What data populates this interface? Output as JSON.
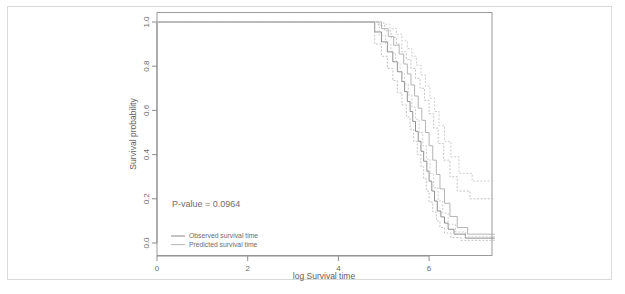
{
  "figure": {
    "background": "#ffffff",
    "frame_color": "#d9d9d9"
  },
  "chart_data": {
    "type": "line",
    "title": "",
    "subtitle": "",
    "xlabel": "log Survival time",
    "ylabel": "Survival probability",
    "xlim": [
      -0.35,
      7.6
    ],
    "ylim": [
      -0.03,
      1.03
    ],
    "xticks": [
      0,
      2,
      4,
      6
    ],
    "xticklabels": [
      "0",
      "2",
      "4",
      "6"
    ],
    "yticks": [
      0.0,
      0.2,
      0.4,
      0.6,
      0.8,
      1.0
    ],
    "yticklabels": [
      "0.0",
      "0.2",
      "0.4",
      "0.6",
      "0.8",
      "1.0"
    ],
    "grid": false,
    "legend_position": "bottom-left",
    "annotations": [
      {
        "name": "p-value",
        "text": "P-value = 0.0964",
        "x": 0.6,
        "y": 0.215
      }
    ],
    "legend": [
      {
        "label": "Observed survival time",
        "color": "#7d7d7d",
        "style": "solid"
      },
      {
        "label": "Predicted survival time",
        "color": "#a8a8a8",
        "style": "solid"
      }
    ],
    "series": [
      {
        "name": "Observed survival time",
        "color": "#7d7d7d",
        "style": "solid",
        "step": "post",
        "x": [
          0.0,
          4.72,
          4.8,
          4.95,
          5.08,
          5.2,
          5.3,
          5.4,
          5.46,
          5.52,
          5.58,
          5.64,
          5.7,
          5.76,
          5.82,
          5.88,
          5.95,
          6.0,
          6.06,
          6.12,
          6.18,
          6.26,
          6.34,
          6.42,
          6.55,
          6.8,
          7.45
        ],
        "y": [
          1.0,
          1.0,
          0.955,
          0.91,
          0.865,
          0.82,
          0.775,
          0.73,
          0.685,
          0.64,
          0.595,
          0.55,
          0.505,
          0.46,
          0.415,
          0.37,
          0.325,
          0.28,
          0.235,
          0.19,
          0.145,
          0.118,
          0.09,
          0.062,
          0.04,
          0.022,
          0.022
        ]
      },
      {
        "name": "Observed lower 95% CI",
        "color": "#b4b4b4",
        "style": "dashed",
        "step": "post",
        "x": [
          0.0,
          4.72,
          4.8,
          4.95,
          5.08,
          5.2,
          5.3,
          5.4,
          5.5,
          5.58,
          5.66,
          5.74,
          5.82,
          5.88,
          5.94,
          6.0,
          6.08,
          6.16,
          6.24,
          6.34,
          6.48,
          6.7,
          7.45
        ],
        "y": [
          1.0,
          1.0,
          0.9,
          0.845,
          0.79,
          0.735,
          0.68,
          0.625,
          0.57,
          0.515,
          0.46,
          0.4,
          0.345,
          0.29,
          0.235,
          0.185,
          0.14,
          0.1,
          0.07,
          0.045,
          0.025,
          0.012,
          0.012
        ]
      },
      {
        "name": "Observed upper 95% CI",
        "color": "#b4b4b4",
        "style": "dashed",
        "step": "post",
        "x": [
          0.0,
          4.72,
          4.88,
          5.02,
          5.16,
          5.28,
          5.4,
          5.5,
          5.6,
          5.7,
          5.8,
          5.9,
          6.0,
          6.1,
          6.2,
          6.32,
          6.46,
          6.62,
          6.9,
          7.45
        ],
        "y": [
          1.0,
          1.0,
          0.985,
          0.96,
          0.93,
          0.9,
          0.865,
          0.83,
          0.79,
          0.745,
          0.7,
          0.645,
          0.585,
          0.52,
          0.45,
          0.375,
          0.3,
          0.235,
          0.2,
          0.2
        ]
      },
      {
        "name": "Predicted survival time",
        "color": "#a8a8a8",
        "style": "solid",
        "step": "post",
        "x": [
          0.0,
          4.8,
          4.95,
          5.1,
          5.22,
          5.34,
          5.44,
          5.52,
          5.6,
          5.68,
          5.76,
          5.84,
          5.92,
          6.0,
          6.08,
          6.16,
          6.24,
          6.34,
          6.46,
          6.62,
          6.85,
          7.45
        ],
        "y": [
          1.0,
          1.0,
          0.97,
          0.935,
          0.895,
          0.855,
          0.81,
          0.765,
          0.715,
          0.665,
          0.61,
          0.555,
          0.5,
          0.44,
          0.375,
          0.31,
          0.245,
          0.18,
          0.12,
          0.07,
          0.04,
          0.04
        ]
      },
      {
        "name": "Predicted lower 95% CI",
        "color": "#c2c2c2",
        "style": "dashed",
        "step": "post",
        "x": [
          0.0,
          4.78,
          4.9,
          5.04,
          5.16,
          5.26,
          5.36,
          5.46,
          5.54,
          5.62,
          5.7,
          5.78,
          5.86,
          5.94,
          6.02,
          6.1,
          6.2,
          6.3,
          6.42,
          6.58,
          6.8,
          7.45
        ],
        "y": [
          1.0,
          1.0,
          0.94,
          0.9,
          0.86,
          0.815,
          0.77,
          0.72,
          0.67,
          0.615,
          0.56,
          0.5,
          0.44,
          0.38,
          0.315,
          0.25,
          0.19,
          0.135,
          0.085,
          0.05,
          0.028,
          0.028
        ]
      },
      {
        "name": "Predicted upper 95% CI",
        "color": "#c2c2c2",
        "style": "dashed",
        "step": "post",
        "x": [
          0.0,
          4.85,
          5.0,
          5.14,
          5.28,
          5.4,
          5.52,
          5.62,
          5.72,
          5.82,
          5.92,
          6.02,
          6.12,
          6.22,
          6.34,
          6.48,
          6.66,
          6.95,
          7.45
        ],
        "y": [
          1.0,
          1.0,
          0.99,
          0.97,
          0.945,
          0.915,
          0.88,
          0.845,
          0.805,
          0.76,
          0.71,
          0.655,
          0.595,
          0.53,
          0.46,
          0.39,
          0.315,
          0.28,
          0.28
        ]
      }
    ]
  }
}
